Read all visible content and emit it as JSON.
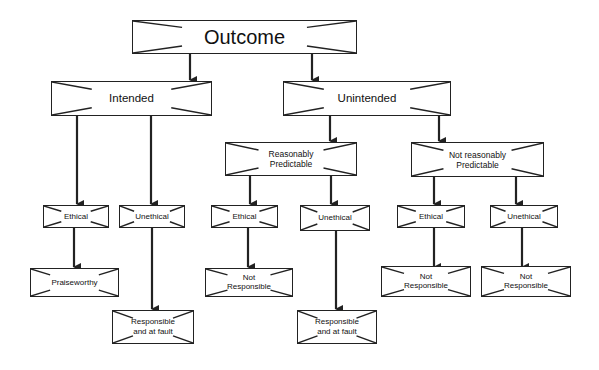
{
  "diagram": {
    "type": "decision-tree",
    "colors": {
      "line": "#222222",
      "box_fill": "#ffffff",
      "background": "#ffffff"
    },
    "nodes": {
      "outcome": {
        "label": "Outcome"
      },
      "intended": {
        "label": "Intended"
      },
      "unintended": {
        "label": "Unintended"
      },
      "reasonably_predictable": {
        "label": "Reasonably\nPredictable"
      },
      "not_reasonably_predictable": {
        "label": "Not reasonably\nPredictable"
      },
      "intended_ethical": {
        "label": "Ethical"
      },
      "intended_unethical": {
        "label": "Unethical"
      },
      "rp_ethical": {
        "label": "Ethical"
      },
      "rp_unethical": {
        "label": "Unethical"
      },
      "nrp_ethical": {
        "label": "Ethical"
      },
      "nrp_unethical": {
        "label": "Unethical"
      },
      "praiseworthy": {
        "label": "Praiseworthy"
      },
      "rp_ethical_result": {
        "label": "Not\nResponsible"
      },
      "nrp_ethical_result": {
        "label": "Not\nResponsible"
      },
      "nrp_unethical_result": {
        "label": "Not\nResponsible"
      },
      "intended_unethical_result": {
        "label": "Responsible\nand at fault"
      },
      "rp_unethical_result": {
        "label": "Responsible\nand at fault"
      }
    },
    "edges": [
      [
        "outcome",
        "intended"
      ],
      [
        "outcome",
        "unintended"
      ],
      [
        "intended",
        "intended_ethical"
      ],
      [
        "intended",
        "intended_unethical"
      ],
      [
        "unintended",
        "reasonably_predictable"
      ],
      [
        "unintended",
        "not_reasonably_predictable"
      ],
      [
        "reasonably_predictable",
        "rp_ethical"
      ],
      [
        "reasonably_predictable",
        "rp_unethical"
      ],
      [
        "not_reasonably_predictable",
        "nrp_ethical"
      ],
      [
        "not_reasonably_predictable",
        "nrp_unethical"
      ],
      [
        "intended_ethical",
        "praiseworthy"
      ],
      [
        "intended_unethical",
        "intended_unethical_result"
      ],
      [
        "rp_ethical",
        "rp_ethical_result"
      ],
      [
        "rp_unethical",
        "rp_unethical_result"
      ],
      [
        "nrp_ethical",
        "nrp_ethical_result"
      ],
      [
        "nrp_unethical",
        "nrp_unethical_result"
      ]
    ]
  }
}
